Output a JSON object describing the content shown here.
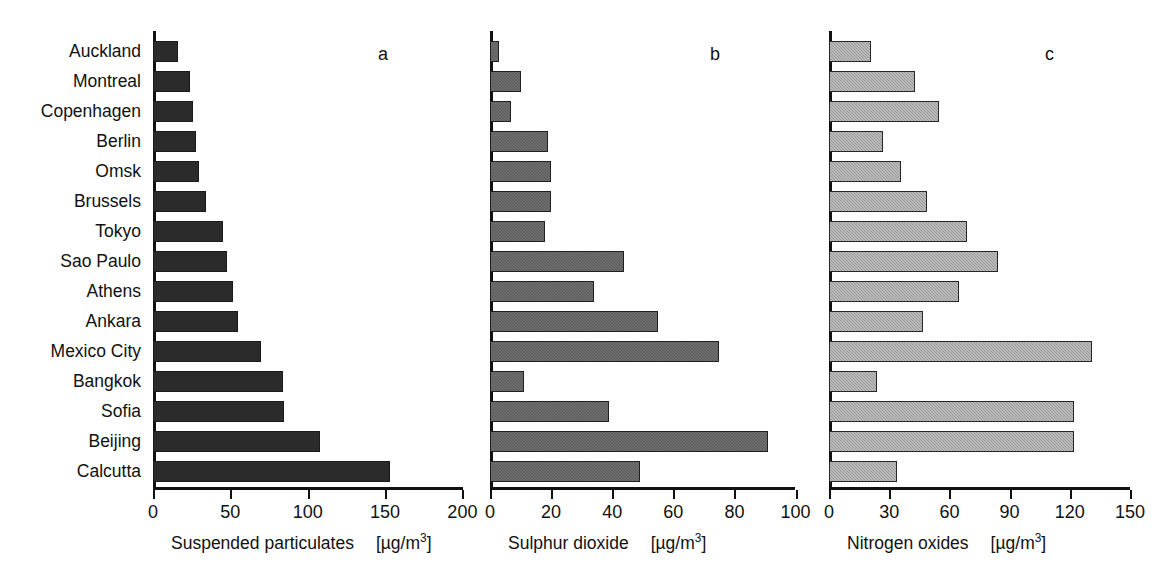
{
  "chart_data": {
    "type": "bar",
    "orientation": "horizontal",
    "title": "",
    "categories": [
      "Auckland",
      "Montreal",
      "Copenhagen",
      "Berlin",
      "Omsk",
      "Brussels",
      "Tokyo",
      "Sao Paulo",
      "Athens",
      "Ankara",
      "Mexico City",
      "Bangkok",
      "Sofia",
      "Beijing",
      "Calcutta"
    ],
    "panels": [
      {
        "letter": "a",
        "xlabel": "Suspended particulates",
        "unit": "[µg/m³]",
        "unit_base": "[µg/m",
        "unit_exp": "3",
        "unit_close": "]",
        "xlim": [
          0,
          200
        ],
        "ticks": [
          0,
          50,
          100,
          150,
          200
        ],
        "ticklabels": [
          "0",
          "50",
          "100",
          "150",
          "200"
        ],
        "values": [
          16,
          24,
          26,
          28,
          30,
          34,
          45,
          48,
          52,
          55,
          70,
          84,
          85,
          108,
          153
        ],
        "color": "#2b2b2b"
      },
      {
        "letter": "b",
        "xlabel": "Sulphur dioxide",
        "unit": "[µg/m³]",
        "unit_base": "[µg/m",
        "unit_exp": "3",
        "unit_close": "]",
        "xlim": [
          0,
          100
        ],
        "ticks": [
          0,
          20,
          40,
          60,
          80,
          100
        ],
        "ticklabels": [
          "0",
          "20",
          "40",
          "60",
          "80",
          "100"
        ],
        "values": [
          3,
          10,
          7,
          19,
          20,
          20,
          18,
          44,
          34,
          55,
          75,
          11,
          39,
          91,
          49
        ],
        "color": "#5c5c5c"
      },
      {
        "letter": "c",
        "xlabel": "Nitrogen oxides",
        "unit": "[µg/m³]",
        "unit_base": "[µg/m",
        "unit_exp": "3",
        "unit_close": "]",
        "xlim": [
          0,
          150
        ],
        "ticks": [
          0,
          30,
          60,
          90,
          120,
          150
        ],
        "ticklabels": [
          "0",
          "30",
          "60",
          "90",
          "120",
          "150"
        ],
        "values": [
          21,
          43,
          55,
          27,
          36,
          49,
          69,
          84,
          65,
          47,
          131,
          24,
          122,
          122,
          34
        ],
        "color": "#9b9b9b"
      }
    ],
    "ylabel": "",
    "grid": false,
    "legend": null
  },
  "layout": {
    "panel_left": [
      153,
      490,
      829
    ],
    "panel_px_per_unit": [
      1.547,
      3.055,
      2.007
    ],
    "axis_width": [
      310,
      305,
      301
    ],
    "row_pitch": 30,
    "bar_height": 21,
    "first_row_top": 41
  }
}
